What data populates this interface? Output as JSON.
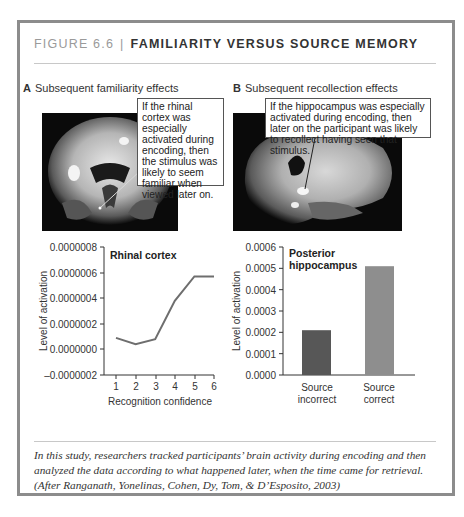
{
  "figure": {
    "number": "FIGURE 6.6",
    "separator": "|",
    "title": "FAMILIARITY VERSUS SOURCE MEMORY"
  },
  "panels": [
    {
      "letter": "A",
      "title": "Subsequent familiarity effects",
      "callout": "If the rhinal cortex was especially activated during encoding, then the stimulus was likely to seem familiar when viewed later on.",
      "image": "coronal-brain-scan"
    },
    {
      "letter": "B",
      "title": "Subsequent recollection effects",
      "callout": "If the hippocampus was especially activated during encoding, then later on the participant was likely to recollect having seen that stimulus.",
      "image": "sagittal-brain-scan"
    }
  ],
  "chart_data": [
    {
      "type": "line",
      "title": "Rhinal cortex",
      "xlabel": "Recognition confidence",
      "ylabel": "Level of activation",
      "x": [
        1,
        2,
        3,
        4,
        5,
        6
      ],
      "values": [
        9e-08,
        4e-08,
        8e-08,
        3.8e-07,
        5.7e-07,
        5.7e-07
      ],
      "ylim": [
        -2e-07,
        8e-07
      ],
      "yticks": [
        "0.0000008",
        "0.0000006",
        "0.0000004",
        "0.0000002",
        "0.0000000",
        "–0.0000002"
      ],
      "xticks": [
        "1",
        "2",
        "3",
        "4",
        "5",
        "6"
      ],
      "grid": false,
      "line_color": "#6e6e6e"
    },
    {
      "type": "bar",
      "title": "Posterior hippocampus",
      "title_lines": [
        "Posterior",
        "hippocampus"
      ],
      "xlabel": "",
      "ylabel": "Level of activation",
      "categories": [
        "Source incorrect",
        "Source correct"
      ],
      "category_lines": [
        [
          "Source",
          "incorrect"
        ],
        [
          "Source",
          "correct"
        ]
      ],
      "values": [
        0.00021,
        0.00051
      ],
      "ylim": [
        0,
        0.0006
      ],
      "yticks": [
        "0.0006",
        "0.0005",
        "0.0004",
        "0.0003",
        "0.0002",
        "0.0001",
        "0.0000"
      ],
      "grid": false,
      "bar_colors": [
        "#575757",
        "#8e8e8e"
      ]
    }
  ],
  "caption": {
    "text": "In this study, researchers tracked participants’ brain activity during encoding and then analyzed the data according to what happened later, when the time came for retrieval.",
    "citation": "(After Ranganath, Yonelinas, Cohen, Dy, Tom, & D’Esposito, 2003)"
  }
}
